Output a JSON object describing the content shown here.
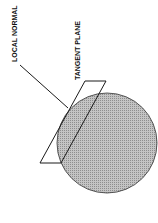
{
  "diagram": {
    "labels": {
      "local_normal": "LOCAL NORMAL",
      "tangent_plane": "TANGENT PLANE"
    },
    "colors": {
      "sphere_fill": "#b4b4b4",
      "line": "#1a1a1a",
      "background": "#ffffff"
    },
    "elements": [
      "sphere",
      "tangent-plane",
      "local-normal"
    ]
  }
}
